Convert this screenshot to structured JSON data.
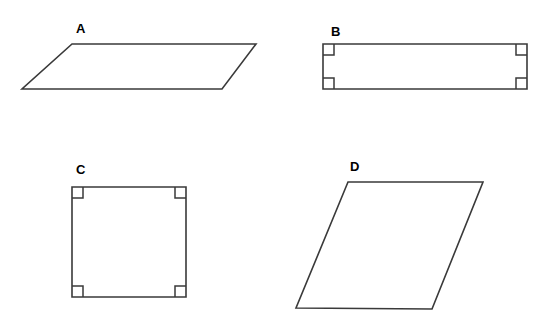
{
  "figure": {
    "width": 544,
    "height": 318,
    "background_color": "#ffffff",
    "stroke_color": "#3a3a3a",
    "label_color": "#000000"
  },
  "shapes": [
    {
      "id": "a",
      "label": "A",
      "kind": "parallelogram",
      "label_x": 76,
      "label_y": 22,
      "vertices": "72,44 256,44 222,89 22,89",
      "right_angle_markers": []
    },
    {
      "id": "b",
      "label": "B",
      "kind": "rectangle",
      "label_x": 331,
      "label_y": 25,
      "vertices": "323,44 527,44 527,89 323,89",
      "right_angle_markers": [
        "323,55 334,55 334,44",
        "527,55 516,55 516,44",
        "323,78 334,78 334,89",
        "527,78 516,78 516,89"
      ]
    },
    {
      "id": "c",
      "label": "C",
      "kind": "square",
      "label_x": 76,
      "label_y": 163,
      "vertices": "72,187 186,187 186,297 72,297",
      "right_angle_markers": [
        "72,198 83,198 83,187",
        "186,198 175,198 175,187",
        "72,286 83,286 83,297",
        "186,286 175,286 175,297"
      ]
    },
    {
      "id": "d",
      "label": "D",
      "kind": "parallelogram",
      "label_x": 350,
      "label_y": 160,
      "vertices": "348,182 483,182 432,309 296,308",
      "right_angle_markers": []
    }
  ]
}
